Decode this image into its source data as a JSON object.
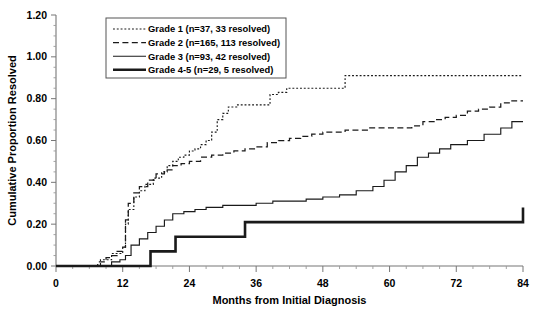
{
  "chart_data": {
    "type": "line",
    "title": "",
    "xlabel": "Months from Initial Diagnosis",
    "ylabel": "Cumulative Proportion Resolved",
    "xlim": [
      0,
      84
    ],
    "ylim": [
      0,
      1.2
    ],
    "xticks": [
      0,
      12,
      24,
      36,
      48,
      60,
      72,
      84
    ],
    "xticklabels": [
      "0",
      "12",
      "24",
      "36",
      "48",
      "60",
      "72",
      "84"
    ],
    "yticks": [
      0.0,
      0.2,
      0.4,
      0.6,
      0.8,
      1.0,
      1.2
    ],
    "yticklabels": [
      "0.00",
      "0.20",
      "0.40",
      "0.60",
      "0.80",
      "1.00",
      "1.20"
    ],
    "grid": false,
    "legend_position": "upper-left",
    "step_style": "post",
    "series": [
      {
        "name": "Grade 1 (n=37, 33 resolved)",
        "label": "Grade 1",
        "n": 37,
        "resolved": 33,
        "line_style": "dotted",
        "color": "#1a1a1a",
        "x": [
          0,
          6.5,
          8.0,
          9.0,
          10.0,
          11.0,
          12.0,
          12.5,
          13.0,
          14.0,
          15.0,
          16.0,
          17.5,
          19.0,
          20.0,
          21.0,
          22.0,
          23.0,
          24.0,
          25.0,
          26.0,
          27.0,
          28.0,
          29.0,
          30.0,
          31.0,
          32.5,
          34.0,
          36.0,
          38.5,
          40.0,
          41.5,
          52.0,
          84.0
        ],
        "y": [
          0.0,
          0.0,
          0.03,
          0.03,
          0.06,
          0.06,
          0.09,
          0.2,
          0.27,
          0.33,
          0.36,
          0.39,
          0.42,
          0.45,
          0.48,
          0.5,
          0.52,
          0.53,
          0.55,
          0.56,
          0.58,
          0.6,
          0.64,
          0.7,
          0.73,
          0.76,
          0.77,
          0.77,
          0.77,
          0.82,
          0.83,
          0.85,
          0.91,
          0.91
        ]
      },
      {
        "name": "Grade 2 (n=165, 113 resolved)",
        "label": "Grade 2",
        "n": 165,
        "resolved": 113,
        "line_style": "dashed",
        "color": "#1a1a1a",
        "x": [
          0,
          6.0,
          7.5,
          9.0,
          10.0,
          11.0,
          12.0,
          12.5,
          13.0,
          14.0,
          15.0,
          16.5,
          18.0,
          19.5,
          21.0,
          22.5,
          24.0,
          26.0,
          28.0,
          30.0,
          32.0,
          34.0,
          36.0,
          38.0,
          40.0,
          42.0,
          44.0,
          46.0,
          48.0,
          52.0,
          56.0,
          60.0,
          64.0,
          66.0,
          68.0,
          70.0,
          72.0,
          74.0,
          76.0,
          78.0,
          80.0,
          82.0,
          84.0
        ],
        "y": [
          0.0,
          0.0,
          0.02,
          0.04,
          0.05,
          0.07,
          0.09,
          0.22,
          0.3,
          0.35,
          0.38,
          0.41,
          0.44,
          0.46,
          0.48,
          0.49,
          0.5,
          0.52,
          0.53,
          0.54,
          0.55,
          0.56,
          0.57,
          0.59,
          0.6,
          0.61,
          0.62,
          0.63,
          0.64,
          0.65,
          0.66,
          0.66,
          0.67,
          0.69,
          0.7,
          0.71,
          0.72,
          0.74,
          0.75,
          0.76,
          0.78,
          0.79,
          0.79
        ]
      },
      {
        "name": "Grade 3 (n=93, 42 resolved)",
        "label": "Grade 3",
        "n": 93,
        "resolved": 42,
        "line_style": "solid",
        "color": "#1a1a1a",
        "x": [
          0,
          8.0,
          10.0,
          11.5,
          12.5,
          13.5,
          15.0,
          16.5,
          18.0,
          19.5,
          21.0,
          23.0,
          25.0,
          27.0,
          30.0,
          33.0,
          36.0,
          39.0,
          42.0,
          45.0,
          48.0,
          51.0,
          54.0,
          57.0,
          59.0,
          61.0,
          63.0,
          65.0,
          67.0,
          69.0,
          71.0,
          74.0,
          77.0,
          80.0,
          82.0,
          84.0
        ],
        "y": [
          0.0,
          0.0,
          0.02,
          0.03,
          0.05,
          0.1,
          0.13,
          0.16,
          0.19,
          0.22,
          0.25,
          0.26,
          0.27,
          0.28,
          0.29,
          0.29,
          0.3,
          0.31,
          0.31,
          0.32,
          0.33,
          0.34,
          0.36,
          0.38,
          0.41,
          0.45,
          0.48,
          0.52,
          0.54,
          0.56,
          0.58,
          0.6,
          0.63,
          0.66,
          0.69,
          0.69
        ]
      },
      {
        "name": "Grade 4-5 (n=29, 5 resolved)",
        "label": "Grade 4-5",
        "n": 29,
        "resolved": 5,
        "line_style": "solid-bold",
        "color": "#1a1a1a",
        "x": [
          0,
          12.3,
          17.0,
          21.5,
          34.0,
          84.0
        ],
        "y": [
          0.0,
          0.0,
          0.07,
          0.14,
          0.21,
          0.28
        ]
      }
    ]
  },
  "legend": {
    "entries": [
      {
        "label": "Grade 1 (n=37, 33 resolved)",
        "style": "dotted"
      },
      {
        "label": "Grade 2 (n=165, 113 resolved)",
        "style": "dashed"
      },
      {
        "label": "Grade 3 (n=93, 42 resolved)",
        "style": "solid"
      },
      {
        "label": "Grade 4-5 (n=29, 5 resolved)",
        "style": "solid-bold"
      }
    ]
  }
}
